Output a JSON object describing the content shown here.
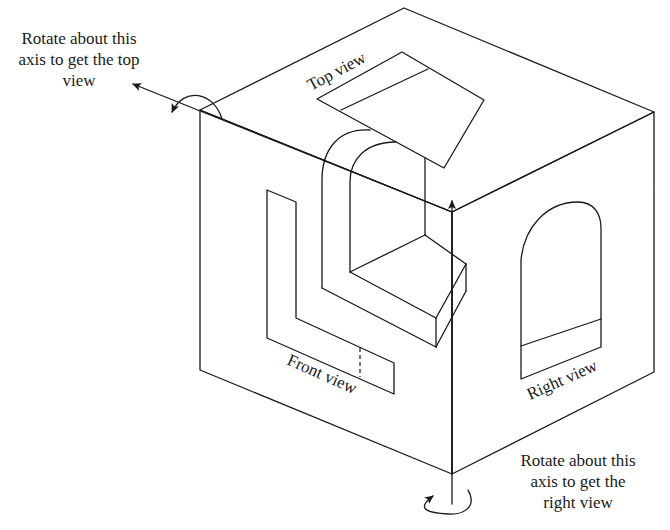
{
  "diagram": {
    "type": "orthographic-projection-glass-box",
    "labels": {
      "top_view": "Top view",
      "front_view": "Front view",
      "right_view": "Right view"
    },
    "annotations": {
      "top_axis_caption": {
        "line1": "Rotate about this",
        "line2": "axis to get the top",
        "line3": "view"
      },
      "right_axis_caption": {
        "line1": "Rotate about this",
        "line2": "axis to get the",
        "line3": "right view"
      }
    },
    "stroke_color": "#1a1a1a",
    "background": "#ffffff"
  }
}
